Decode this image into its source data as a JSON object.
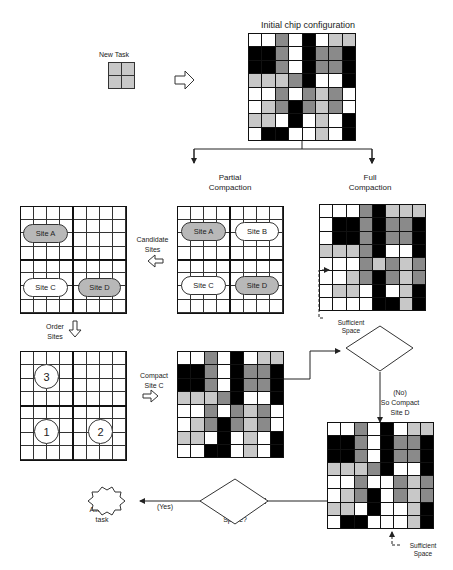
{
  "title": "Initial chip configuration",
  "new_task": {
    "label": "New Task"
  },
  "branches": {
    "partial": [
      "Partial",
      "Compaction"
    ],
    "full": [
      "Full",
      "Compaction"
    ]
  },
  "steps": {
    "candidate_sites": [
      "Candidate",
      "Sites"
    ],
    "order_sites": [
      "Order",
      "Sites"
    ],
    "compact_site_c": [
      "Compact",
      "Site C"
    ]
  },
  "sites": {
    "a": "Site A",
    "b": "Site B",
    "c": "Site C",
    "d": "Site D"
  },
  "order": {
    "first": "1",
    "second": "2",
    "third": "3"
  },
  "decisions": {
    "sufficient_space_1": [
      "Sufficient",
      "Space?"
    ],
    "no_branch": [
      "(No)",
      "So Compact",
      "Site D"
    ],
    "sufficient_space_2": [
      "Sufficient",
      "Space?"
    ],
    "yes_branch": "(Yes)"
  },
  "annotations": {
    "sufficient_space_full": [
      "Sufficient",
      "Space"
    ],
    "sufficient_space_d": [
      "Sufficient",
      "Space"
    ]
  },
  "terminal": [
    "Allocate",
    "task"
  ],
  "legend_colors": {
    "white": "#ffffff",
    "light": "#c8c8c8",
    "mid": "#8a8a8a",
    "black": "#000000"
  },
  "grids": {
    "initial": [
      "wwmwkwll",
      "kkmwkmmk",
      "kkmwkmmk",
      "lllmkwwk",
      "wwmwmlmw",
      "wlmkmlmw",
      "llwkwlwk",
      "wkkwwlwk"
    ],
    "full": [
      "wwwmklll",
      "wkkmkmmk",
      "wkkmkmmk",
      "lllmkwwk",
      "wwwmlmlm",
      "wwlmkmlm",
      "wllwkwlk",
      "wwwwkklk"
    ],
    "site_c": [
      "wwmwkwll",
      "kkmwkmmk",
      "kkmwkmmk",
      "lllmkwwk",
      "wwmwmlmw",
      "wlmkmlmw",
      "llwkwlwk",
      "wwkkwlwk"
    ],
    "site_d": [
      "wwmwkwll",
      "kkmwkmmk",
      "kkmwkmmk",
      "lllmkwwk",
      "wwmwwmlm",
      "wlmkwmlm",
      "llwkwwlk",
      "wkkwwwlk"
    ]
  }
}
